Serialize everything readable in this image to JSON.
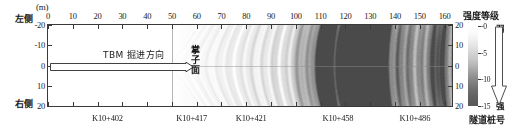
{
  "figure": {
    "unit_label": "(m)",
    "left_side_label": "左侧",
    "right_side_label": "右侧",
    "tunnel_face_label": "掌子面",
    "tbm_direction_label": "TBM 掘进方向",
    "stake_axis_title": "隧道桩号",
    "colorbar_title": "强度等级",
    "colorbar_weak_label": "弱",
    "colorbar_strong_label": "强"
  },
  "chart_data": {
    "type": "heatmap",
    "title": "",
    "xlabel": "隧道桩号",
    "ylabel": "(m)",
    "xlim": [
      0,
      163
    ],
    "ylim": [
      -20,
      20
    ],
    "grid": false,
    "x_ticks": [
      0,
      10,
      20,
      30,
      40,
      50,
      60,
      70,
      80,
      90,
      100,
      110,
      120,
      130,
      140,
      150,
      160
    ],
    "y_ticks": [
      -20,
      -10,
      0,
      10,
      20
    ],
    "y_tick_labels": [
      "-20",
      "-10",
      "0",
      "10",
      "20"
    ],
    "y_ticks_right": [
      -20,
      -10,
      0,
      10,
      20
    ],
    "y_tick_labels_right": [
      "20",
      "10",
      "0",
      "10",
      "20"
    ],
    "colorbar": {
      "ticks": [
        0,
        -5,
        -10,
        -15
      ],
      "tick_labels": [
        "-0",
        "-5",
        "-10",
        "-15"
      ],
      "range": [
        -15,
        0
      ],
      "low_end_label": "弱",
      "high_end_label": "强",
      "title": "强度等级",
      "colors": [
        "#ffffff",
        "#595959"
      ]
    },
    "annotations": [
      {
        "name": "tunnel-face-line",
        "x": 50,
        "label": "掌子面"
      },
      {
        "name": "tbm-direction-arrow",
        "x_start": 0,
        "x_end": 50,
        "y": 0,
        "label": "TBM 掘进方向"
      }
    ],
    "stake_labels": [
      {
        "label": "K10+402",
        "x": 24
      },
      {
        "label": "K10+417",
        "x": 58
      },
      {
        "label": "K10+421",
        "x": 82
      },
      {
        "label": "K10+458",
        "x": 117
      },
      {
        "label": "K10+486",
        "x": 148
      }
    ],
    "reflection_bands": [
      {
        "x": 110,
        "intensity": -13
      },
      {
        "x": 121,
        "intensity": -14
      },
      {
        "x": 126,
        "intensity": -12
      },
      {
        "x": 133,
        "intensity": -15
      },
      {
        "x": 157,
        "intensity": -12
      }
    ]
  }
}
